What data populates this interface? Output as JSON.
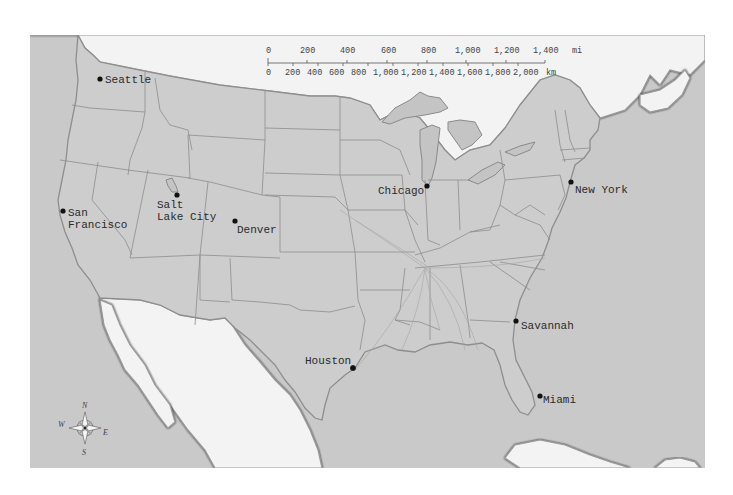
{
  "map": {
    "title": "United States cities map",
    "colors": {
      "ocean": "#c9c9c9",
      "us_land": "#cdcdcd",
      "foreign_land": "#f3f3f3",
      "borders": "#8d8d8d",
      "city_marker": "#111111"
    },
    "scale_bar": {
      "miles_ticks": [
        "0",
        "200",
        "400",
        "600",
        "800",
        "1,000",
        "1,200",
        "1,400"
      ],
      "miles_unit": "mi",
      "km_ticks": [
        "0",
        "200",
        "400",
        "600",
        "800",
        "1,000",
        "1,200",
        "1,400",
        "1,600",
        "1,800",
        "2,000"
      ],
      "km_unit": "km"
    },
    "compass": {
      "n": "N",
      "s": "S",
      "e": "E",
      "w": "W"
    },
    "cities": [
      {
        "name": "Seattle",
        "label": "Seattle"
      },
      {
        "name": "San Francisco",
        "label_line1": "San",
        "label_line2": "Francisco"
      },
      {
        "name": "Salt Lake City",
        "label_line1": "Salt",
        "label_line2": "Lake City"
      },
      {
        "name": "Denver",
        "label": "Denver"
      },
      {
        "name": "Chicago",
        "label": "Chicago"
      },
      {
        "name": "New York",
        "label": "New York"
      },
      {
        "name": "Houston",
        "label": "Houston"
      },
      {
        "name": "Savannah",
        "label": "Savannah"
      },
      {
        "name": "Miami",
        "label": "Miami"
      }
    ]
  }
}
